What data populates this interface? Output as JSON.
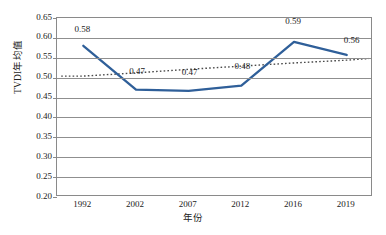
{
  "chart_data": {
    "type": "line",
    "title": "",
    "xlabel": "年份",
    "ylabel": "TVDI年均值",
    "categories": [
      "1992",
      "2002",
      "2007",
      "2012",
      "2016",
      "2019"
    ],
    "ylim": [
      0.2,
      0.65
    ],
    "ytick_step": 0.05,
    "yticks": [
      "0.65",
      "0.60",
      "0.55",
      "0.50",
      "0.45",
      "0.40",
      "0.35",
      "0.30",
      "0.25",
      "0.20"
    ],
    "grid": true,
    "legend": "none",
    "series": [
      {
        "name": "TVDI年均值",
        "style": "solid",
        "color": "#2F5F99",
        "values": [
          0.58,
          0.47,
          0.467,
          0.48,
          0.59,
          0.557
        ],
        "data_labels": [
          "0.58",
          "0.47",
          "0.47",
          "0.48",
          "0.59",
          "0.56"
        ]
      },
      {
        "name": "线性趋势线",
        "style": "dotted",
        "color": "#4A4A4A",
        "values": [
          0.504,
          0.512,
          0.521,
          0.529,
          0.537,
          0.544
        ]
      }
    ]
  },
  "labels": {
    "y_axis_title": "TVDI年均值",
    "x_axis_title": "年份"
  }
}
